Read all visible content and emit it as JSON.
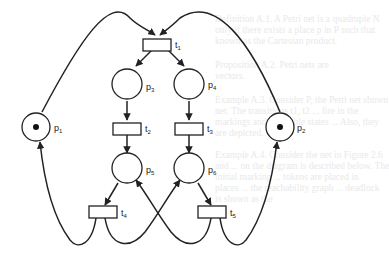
{
  "diagram": {
    "type": "petri-net",
    "places": [
      {
        "id": "p1",
        "label": "p",
        "sub": "1",
        "tokens": 1
      },
      {
        "id": "p2",
        "label": "p",
        "sub": "2",
        "tokens": 1
      },
      {
        "id": "p3",
        "label": "p",
        "sub": "3",
        "tokens": 0
      },
      {
        "id": "p4",
        "label": "p",
        "sub": "4",
        "tokens": 0
      },
      {
        "id": "p5",
        "label": "p",
        "sub": "5",
        "tokens": 0
      },
      {
        "id": "p6",
        "label": "p",
        "sub": "6",
        "tokens": 0
      }
    ],
    "transitions": [
      {
        "id": "t1",
        "label": "t",
        "sub": "1"
      },
      {
        "id": "t2",
        "label": "t",
        "sub": "2"
      },
      {
        "id": "t3",
        "label": "t",
        "sub": "3"
      },
      {
        "id": "t4",
        "label": "t",
        "sub": "4"
      },
      {
        "id": "t5",
        "label": "t",
        "sub": "5"
      }
    ],
    "arcs": [
      [
        "p1",
        "t1"
      ],
      [
        "p2",
        "t1"
      ],
      [
        "t1",
        "p3"
      ],
      [
        "t1",
        "p4"
      ],
      [
        "p3",
        "t2"
      ],
      [
        "p4",
        "t3"
      ],
      [
        "t2",
        "p5"
      ],
      [
        "t3",
        "p6"
      ],
      [
        "p5",
        "t4"
      ],
      [
        "p6",
        "t5"
      ],
      [
        "t4",
        "p1"
      ],
      [
        "t4",
        "p6"
      ],
      [
        "t5",
        "p5"
      ],
      [
        "t5",
        "p2"
      ]
    ]
  },
  "bleed_through_text": [
    "Definition A.1. A Petri net is a quadruple N",
    "only if there exists a place p in P such that",
    "known as the Cartesian product.",
    "Proposition A.2. Petri nets are",
    "vectors.",
    "Example A.3. Consider P, the Petri net shown",
    "net. The transitions t1, t2 ... fire in the",
    "markings and reachable states ... Also, they",
    "are depicted.",
    "Example A.4. Consider the net in Figure 2.6",
    "and ... on the diagram is described below. The",
    "initial marking ... tokens are placed in",
    "places ... the reachability graph ... deadlock",
    "is shown as the"
  ]
}
